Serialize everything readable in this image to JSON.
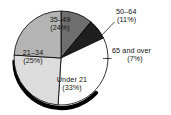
{
  "chart_data": {
    "type": "pie",
    "title": "",
    "subtitle": "",
    "xlabel": "",
    "ylabel": "",
    "legend_position": "none",
    "grid": false,
    "categories": [
      "50–64",
      "65 and over",
      "Under 21",
      "21–34",
      "35–49"
    ],
    "values": [
      11,
      7,
      33,
      25,
      24
    ],
    "value_unit": "%",
    "slices": [
      {
        "name": "50–64",
        "label": "50–64",
        "percent_label": "(11%)",
        "value": 11,
        "color": "#6e6e6e",
        "label_placement": "outside",
        "label_order": 0
      },
      {
        "name": "65 and over",
        "label": "65 and over",
        "percent_label": "(7%)",
        "value": 7,
        "color": "#1f1f1f",
        "label_placement": "outside",
        "label_order": 1
      },
      {
        "name": "Under 21",
        "label": "Under 21",
        "percent_label": "(33%)",
        "value": 33,
        "color": "#ffffff",
        "label_placement": "inside",
        "label_order": 2
      },
      {
        "name": "21–34",
        "label": "21–34",
        "percent_label": "(25%)",
        "value": 25,
        "color": "#dcdcdc",
        "label_placement": "inside",
        "label_order": 3
      },
      {
        "name": "35–49",
        "label": "35–49",
        "percent_label": "(24%)",
        "value": 24,
        "color": "#b4b4b4",
        "label_placement": "inside",
        "label_order": 4
      }
    ],
    "colors": {
      "slice_50_64": "#6e6e6e",
      "slice_65_over": "#1f1f1f",
      "slice_under_21": "#ffffff",
      "slice_21_34": "#dcdcdc",
      "slice_35_49": "#b4b4b4",
      "outline": "#000000",
      "shadow": "#000000",
      "background": "#ffffff",
      "text": "#111111"
    }
  }
}
